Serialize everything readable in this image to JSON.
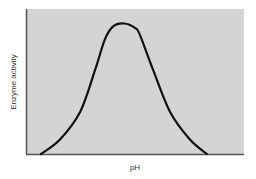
{
  "chart_data": {
    "type": "line",
    "title": "",
    "xlabel": "pH",
    "ylabel": "Enzyme activity",
    "x_ticks": [],
    "y_ticks": [],
    "xlim": [
      0,
      1
    ],
    "ylim": [
      0,
      1
    ],
    "grid": false,
    "legend": null,
    "background_color": "#d4d4d4",
    "line_color": "#111111",
    "series": [
      {
        "name": "Enzyme activity",
        "x": [
          0.069,
          0.156,
          0.248,
          0.317,
          0.362,
          0.4,
          0.45,
          0.5,
          0.523,
          0.583,
          0.661,
          0.752,
          0.83
        ],
        "y": [
          0.0,
          0.1,
          0.29,
          0.58,
          0.79,
          0.88,
          0.9,
          0.87,
          0.82,
          0.58,
          0.29,
          0.1,
          0.0
        ]
      }
    ]
  }
}
